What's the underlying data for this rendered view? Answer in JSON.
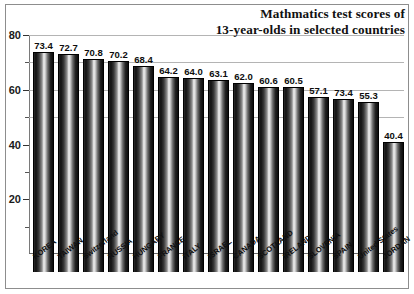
{
  "chart_data": {
    "type": "bar",
    "title": "Mathmatics test scores of 13-year-olds in selected countries",
    "title_lines": [
      "Mathmatics test scores of",
      "13-year-olds in selected countries"
    ],
    "xlabel": "",
    "ylabel": "",
    "ylim": [
      0,
      80
    ],
    "yticks": [
      20,
      40,
      60,
      80
    ],
    "ytick_labels": [
      "20",
      "40",
      "60",
      "80"
    ],
    "minor_yticks": [
      10,
      30,
      50,
      70
    ],
    "gridlines": [
      50,
      60,
      70,
      80
    ],
    "grid": true,
    "legend": "none",
    "categories": [
      "KOREA",
      "TAIWAN",
      "Switzerland",
      "RUSSIA",
      "HUNGARY",
      "FRANCE",
      "ITALY",
      "ISRAEL",
      "CANADA",
      "SCOTLAND",
      "IRELAND",
      "SLOVENIA",
      "SPAIN",
      "United States",
      "JORDAN"
    ],
    "values": [
      73.4,
      72.7,
      70.8,
      70.2,
      68.4,
      64.2,
      64.0,
      63.1,
      62.0,
      60.6,
      60.5,
      57.1,
      56.2,
      55.3,
      40.4
    ],
    "value_labels": [
      "73.4",
      "72.7",
      "70.8",
      "70.2",
      "68.4",
      "64.2",
      "64.0",
      "63.1",
      "62.0",
      "60.6",
      "60.5",
      "57.1",
      "73.4",
      "55.3",
      "40.4"
    ],
    "colors": {
      "bar_dark": "#0b0b0b",
      "bar_highlight": "#f2f2f2",
      "gridline": "#b4b4b4",
      "axis": "#6a6a6a",
      "text": "#111111",
      "background": "#ffffff"
    }
  }
}
